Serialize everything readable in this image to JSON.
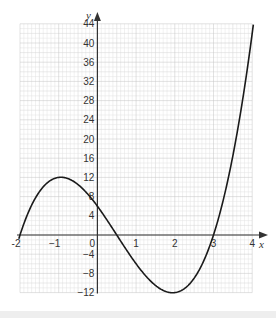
{
  "chart_data": {
    "type": "line",
    "title": "",
    "xlabel": "x",
    "ylabel": "y",
    "function": "y = (x+2)(2x-1)(x-3)",
    "xlim": [
      -2,
      4
    ],
    "ylim": [
      -12,
      44
    ],
    "grid": true,
    "x_ticks": [
      -2,
      -1,
      0,
      1,
      2,
      3,
      4
    ],
    "x_tick_labels": [
      "-2",
      "−1",
      "0",
      "1",
      "2",
      "3",
      "4"
    ],
    "y_ticks": [
      -12,
      -8,
      -4,
      4,
      8,
      12,
      16,
      20,
      24,
      28,
      32,
      36,
      40,
      44
    ],
    "y_tick_labels": [
      "−12",
      "−8",
      "−4",
      "4",
      "8",
      "12",
      "16",
      "20",
      "24",
      "28",
      "32",
      "36",
      "40",
      "44"
    ],
    "series": [
      {
        "name": "curve",
        "x": [
          -2,
          -1.5,
          -1,
          -0.5,
          0,
          0.5,
          1,
          1.5,
          2,
          2.5,
          3,
          3.5,
          4.03
        ],
        "y": [
          0,
          9,
          12,
          10.5,
          6,
          0,
          -6,
          -10.5,
          -12,
          -9,
          0,
          18,
          44
        ]
      }
    ],
    "key_points": {
      "roots": [
        -2,
        0.5,
        3
      ],
      "local_max": [
        -1,
        12
      ],
      "local_min": [
        2,
        -12
      ],
      "y_intercept": 6
    },
    "colors": {
      "curve": "#1a1a1a",
      "axis": "#333333",
      "grid_major": "#c4c4c4",
      "grid_minor": "#e2e2e2"
    }
  }
}
